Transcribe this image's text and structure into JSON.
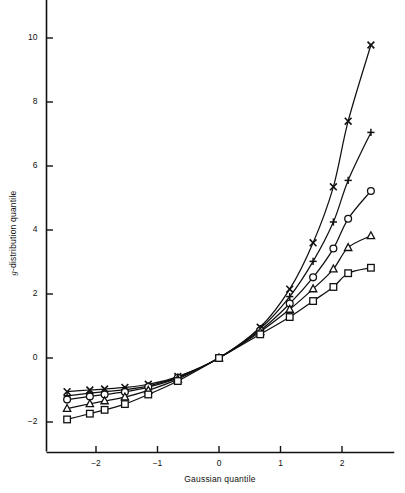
{
  "chart_data": {
    "type": "line",
    "title": "",
    "subtitle": "",
    "xlabel": "Gaussian quantile",
    "ylabel": "g-distribution quantile",
    "xlim": [
      -2.75,
      2.85
    ],
    "ylim": [
      -2.9,
      11.2
    ],
    "xticks": [
      -2,
      -1,
      0,
      1,
      2
    ],
    "xticklabels": [
      "−2",
      "−1",
      "0",
      "1",
      "2"
    ],
    "yticks": [
      -2,
      0,
      2,
      4,
      6,
      8,
      10
    ],
    "yticklabels": [
      "−2",
      "0",
      "2",
      "4",
      "6",
      "8",
      "10"
    ],
    "grid": false,
    "legend_position": "none",
    "x": [
      -2.47,
      -2.1,
      -1.86,
      -1.53,
      -1.15,
      -0.67,
      0.0,
      0.67,
      1.15,
      1.53,
      1.86,
      2.1,
      2.47
    ],
    "series": [
      {
        "name": "g = 1.0",
        "marker": "x",
        "values": [
          -1.05,
          -1.0,
          -0.97,
          -0.92,
          -0.82,
          -0.58,
          0.0,
          0.96,
          2.15,
          3.6,
          5.35,
          7.4,
          9.78
        ]
      },
      {
        "name": "g = 0.8",
        "marker": "plus",
        "values": [
          -1.18,
          -1.1,
          -1.05,
          -0.99,
          -0.87,
          -0.6,
          0.0,
          0.92,
          1.92,
          3.02,
          4.25,
          5.55,
          7.05
        ]
      },
      {
        "name": "g = 0.6",
        "marker": "circle",
        "values": [
          -1.3,
          -1.2,
          -1.14,
          -1.06,
          -0.91,
          -0.62,
          0.0,
          0.86,
          1.7,
          2.52,
          3.42,
          4.35,
          5.22
        ]
      },
      {
        "name": "g = 0.4",
        "marker": "triangle",
        "values": [
          -1.58,
          -1.43,
          -1.34,
          -1.22,
          -1.01,
          -0.66,
          0.0,
          0.82,
          1.52,
          2.16,
          2.78,
          3.45,
          3.82
        ]
      },
      {
        "name": "g = 0.2",
        "marker": "square",
        "values": [
          -1.92,
          -1.74,
          -1.62,
          -1.44,
          -1.14,
          -0.72,
          0.0,
          0.74,
          1.28,
          1.78,
          2.22,
          2.65,
          2.82
        ]
      }
    ]
  },
  "axes": {
    "x_axis_name": "Gaussian quantile",
    "y_axis_name": "g-distribution quantile",
    "y_axis_name_prefix": "g",
    "y_axis_name_suffix": "-distribution quantile"
  },
  "style": {
    "line_color": "#111111",
    "marker_color": "#111111",
    "axis_color": "#111111",
    "background": "#ffffff"
  }
}
